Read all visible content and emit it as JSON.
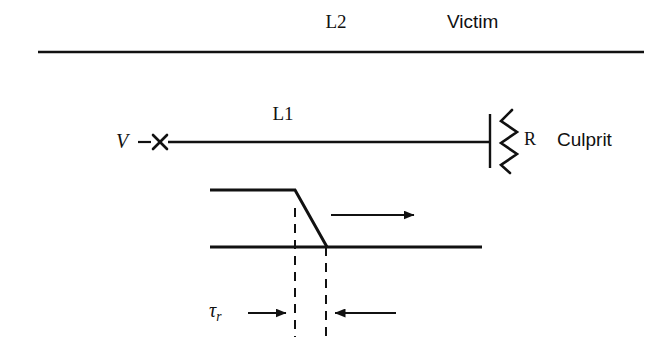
{
  "figure": {
    "background_color": "#ffffff",
    "stroke_color": "#111111"
  },
  "labels": {
    "victim_line": "L2",
    "victim_role": "Victim",
    "culprit_line": "L1",
    "source": "V",
    "resistor": "R",
    "culprit_role": "Culprit",
    "rise_time_symbol": "τ",
    "rise_time_subscript": "r"
  },
  "elements": {
    "victim_conductor": "horizontal-line-top",
    "culprit_conductor": "horizontal-line-l1",
    "source_marker": "x-marker",
    "resistor_terminal": "vertical-terminal-bar",
    "resistor_symbol": "zigzag-resistor",
    "waveform": "falling-edge-signal",
    "propagation_arrow": "rightward-arrow",
    "dimension_left_marker": "dashed-vertical-left",
    "dimension_right_marker": "dashed-vertical-right",
    "dimension_arrow_in_left": "arrow-pointing-right",
    "dimension_arrow_in_right": "arrow-pointing-left"
  },
  "geometry": {
    "victim_line": {
      "x1": 38,
      "x2": 644,
      "y": 52
    },
    "culprit_line": {
      "x1": 168,
      "x2": 490,
      "y": 142
    },
    "source_marker": {
      "cx": 160,
      "cy": 142
    },
    "resistor_terminal": {
      "x": 490,
      "y1": 114,
      "y2": 168
    },
    "resistor_zigzag": {
      "cx": 508,
      "y1": 110,
      "y2": 172
    },
    "waveform_high_y": 190,
    "waveform_base_y": 247,
    "waveform_x_start": 210,
    "waveform_fall_start_x": 295,
    "waveform_fall_end_x": 327,
    "waveform_x_end": 482,
    "propagation_arrow": {
      "x1": 331,
      "x2": 421,
      "y": 215
    },
    "dashed_left": {
      "x": 295,
      "y1": 208,
      "y2": 337
    },
    "dashed_right": {
      "x": 326,
      "y1": 247,
      "y2": 337
    },
    "dim_arrow_left": {
      "x1": 248,
      "x2": 292,
      "y": 313
    },
    "dim_arrow_right": {
      "x1": 396,
      "x2": 329,
      "y": 313
    }
  }
}
